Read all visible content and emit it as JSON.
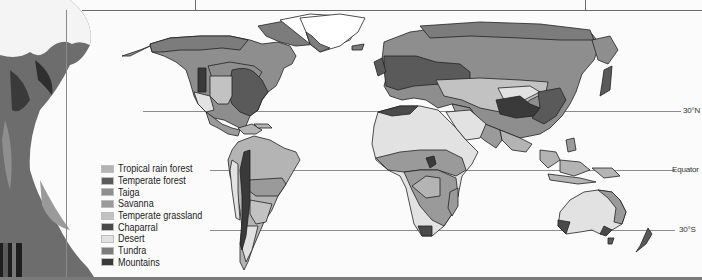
{
  "figure": {
    "type": "world biome map",
    "latitude_lines": [
      {
        "label": "30°N",
        "y": 111
      },
      {
        "label": "Equator",
        "y": 170
      },
      {
        "label": "30°S",
        "y": 230
      }
    ]
  },
  "legend": {
    "items": [
      {
        "label": "Tropical rain forest",
        "color": "#b4b4b4"
      },
      {
        "label": "Temperate forest",
        "color": "#5a5a5a"
      },
      {
        "label": "Taiga",
        "color": "#8e8e8e"
      },
      {
        "label": "Savanna",
        "color": "#9a9a9a"
      },
      {
        "label": "Temperate grassland",
        "color": "#c2c2c2"
      },
      {
        "label": "Chaparral",
        "color": "#4a4a4a"
      },
      {
        "label": "Desert",
        "color": "#e2e2e2"
      },
      {
        "label": "Tundra",
        "color": "#7c7c7c"
      },
      {
        "label": "Mountains",
        "color": "#3a3a3a"
      }
    ]
  },
  "colors": {
    "tropical": "#b4b4b4",
    "temperate_forest": "#5a5a5a",
    "taiga": "#8e8e8e",
    "savanna": "#9a9a9a",
    "grassland": "#c2c2c2",
    "chaparral": "#4a4a4a",
    "desert": "#e2e2e2",
    "tundra": "#7c7c7c",
    "mountains": "#3a3a3a",
    "ice": "#ffffff",
    "outline": "#222222"
  }
}
